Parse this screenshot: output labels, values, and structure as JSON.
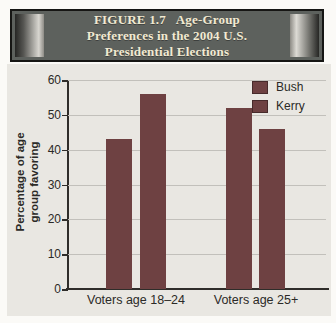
{
  "figure": {
    "banner_title": "FIGURE 1.7   Age-Group\nPreferences in the 2004 U.S.\nPresidential Elections"
  },
  "chart_data": {
    "type": "bar",
    "title": "FIGURE 1.7 Age-Group Preferences in the 2004 U.S. Presidential Elections",
    "categories": [
      "Voters age 18–24",
      "Voters age 25+"
    ],
    "series": [
      {
        "name": "Bush",
        "values": [
          43,
          52
        ]
      },
      {
        "name": "Kerry",
        "values": [
          56,
          46
        ]
      }
    ],
    "ylabel": "Percentage of age\ngroup favoring",
    "xlabel": "",
    "ylim": [
      0,
      60
    ],
    "yticks": [
      0,
      10,
      20,
      30,
      40,
      50,
      60
    ],
    "grid": true,
    "legend_position": "top-right"
  },
  "colors": {
    "bar": "#6e4142",
    "panel_bg": "#e9e7e2",
    "gridline": "#c2c0bb",
    "axis": "#2f2d2a",
    "banner_bg": "#5d615d",
    "banner_text": "#f2ead2"
  }
}
